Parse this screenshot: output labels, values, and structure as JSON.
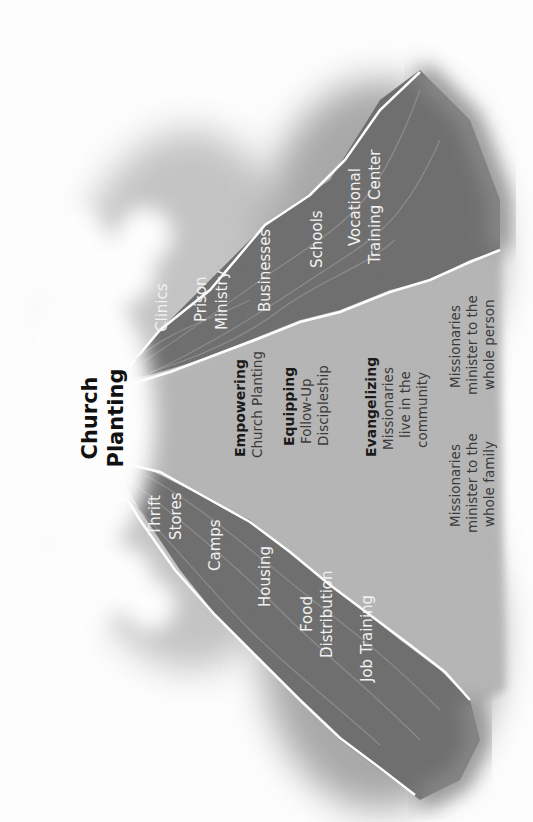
{
  "title": {
    "line1": "Church",
    "line2": "Planting"
  },
  "right_wedge": {
    "items": [
      {
        "lines": [
          "Clinics"
        ]
      },
      {
        "lines": [
          "Prison",
          "Ministry"
        ]
      },
      {
        "lines": [
          "Businesses"
        ]
      },
      {
        "lines": [
          "Schools"
        ]
      },
      {
        "lines": [
          "Vocational",
          "Training Center"
        ]
      }
    ]
  },
  "left_wedge": {
    "items": [
      {
        "lines": [
          "Thrift",
          "Stores"
        ]
      },
      {
        "lines": [
          "Camps"
        ]
      },
      {
        "lines": [
          "Housing"
        ]
      },
      {
        "lines": [
          "Food",
          "Distribution"
        ]
      },
      {
        "lines": [
          "Job Training"
        ]
      }
    ]
  },
  "center": {
    "stages": [
      {
        "heading": "Empowering",
        "lines": [
          "Church Planting"
        ]
      },
      {
        "heading": "Equipping",
        "lines": [
          "Follow-Up",
          "Discipleship"
        ]
      },
      {
        "heading": "Evangelizing",
        "lines": [
          "Missionaries",
          "live in the",
          "community"
        ]
      }
    ],
    "notes": [
      {
        "lines": [
          "Missionaries",
          "minister to the",
          "whole family"
        ]
      },
      {
        "lines": [
          "Missionaries",
          "minister to the",
          "whole person"
        ]
      }
    ]
  },
  "colors": {
    "wedge": "#6e6e6e",
    "center_band": "#b3b3b3",
    "halo": "#bdbdbd",
    "border": "#ffffff",
    "background": "#ffffff"
  }
}
